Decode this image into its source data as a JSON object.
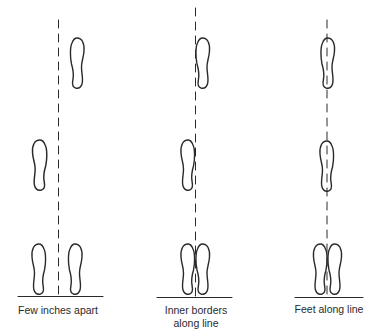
{
  "figure": {
    "type": "diagram",
    "ink_color": "#2a2a2a",
    "background": "#ffffff"
  },
  "panels": [
    {
      "id": "few-inches-apart",
      "caption_lines": [
        "Few inches apart"
      ],
      "description": "Footprints placed a few inches to either side of the dashed line"
    },
    {
      "id": "inner-borders-along-line",
      "caption_lines": [
        "Inner borders",
        "along line"
      ],
      "description": "Inner edges of footprints touching the dashed line"
    },
    {
      "id": "feet-along-line",
      "caption_lines": [
        "Feet along line"
      ],
      "description": "Footprints centered on the dashed line"
    }
  ]
}
